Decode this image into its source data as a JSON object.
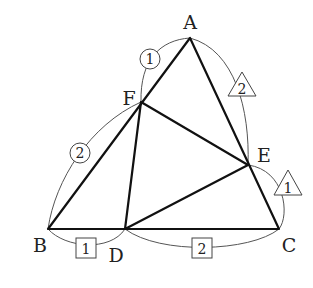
{
  "diagram": {
    "type": "triangle-geometry",
    "points": {
      "A": {
        "label": "A",
        "x": 190,
        "y": 38
      },
      "B": {
        "label": "B",
        "x": 48,
        "y": 229
      },
      "C": {
        "label": "C",
        "x": 279,
        "y": 229
      },
      "D": {
        "label": "D",
        "x": 125,
        "y": 229
      },
      "E": {
        "label": "E",
        "x": 248,
        "y": 165
      },
      "F": {
        "label": "F",
        "x": 141,
        "y": 102
      }
    },
    "segments": [
      "AB",
      "BC",
      "CA",
      "DE",
      "EF",
      "FD"
    ],
    "ratio_markers": {
      "AF": {
        "shape": "circle",
        "value": "1"
      },
      "FB": {
        "shape": "circle",
        "value": "2"
      },
      "BD": {
        "shape": "square",
        "value": "1"
      },
      "DC": {
        "shape": "square",
        "value": "2"
      },
      "CE": {
        "shape": "triangle",
        "value": "1"
      },
      "EA": {
        "shape": "triangle",
        "value": "2"
      }
    }
  }
}
